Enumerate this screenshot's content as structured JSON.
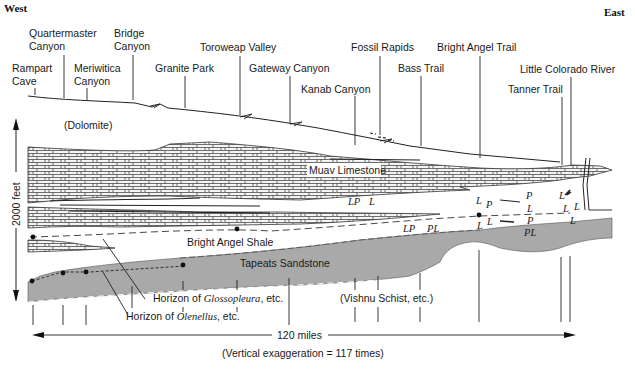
{
  "directions": {
    "west": "West",
    "east": "East"
  },
  "locations": [
    {
      "id": "rampart-cave",
      "line1": "Rampart",
      "line2": "Cave"
    },
    {
      "id": "quartermaster-canyon",
      "line1": "Quartermaster",
      "line2": "Canyon"
    },
    {
      "id": "meriwitica-canyon",
      "line1": "Meriwitica",
      "line2": "Canyon"
    },
    {
      "id": "bridge-canyon",
      "line1": "Bridge",
      "line2": "Canyon"
    },
    {
      "id": "granite-park",
      "line1": "Granite Park"
    },
    {
      "id": "toroweap-valley",
      "line1": "Toroweap Valley"
    },
    {
      "id": "gateway-canyon",
      "line1": "Gateway Canyon"
    },
    {
      "id": "kanab-canyon",
      "line1": "Kanab Canyon"
    },
    {
      "id": "fossil-rapids",
      "line1": "Fossil Rapids"
    },
    {
      "id": "bass-trail",
      "line1": "Bass Trail"
    },
    {
      "id": "bright-angel-trail",
      "line1": "Bright Angel Trail"
    },
    {
      "id": "little-colorado-river",
      "line1": "Little Colorado River"
    },
    {
      "id": "tanner-trail",
      "line1": "Tanner Trail"
    }
  ],
  "formations": {
    "dolomite": "(Dolomite)",
    "muav": "Muav Limestone",
    "shale": "Bright Angel Shale",
    "tapeats": "Tapeats Sandstone",
    "basement": "(Vishnu Schist, etc.)"
  },
  "horizons": {
    "glossopleura_prefix": "Horizon of ",
    "glossopleura_genus": "Glossopleura",
    "glossopleura_suffix": ", etc.",
    "olenellus_prefix": "Horizon of ",
    "olenellus_genus": "Olenellus",
    "olenellus_suffix": ", etc."
  },
  "fossil_markers": {
    "lp1": "LP",
    "l1": "L",
    "lp2": "LP",
    "pl1": "PL",
    "l_ba1": "L",
    "p_ba1": "P",
    "l_ba2": "L",
    "l_ba3": "L",
    "p_e1": "P",
    "l_e1": "L",
    "p_e2": "P",
    "pl_e": "PL",
    "l_t1": "L",
    "l_t2": "L",
    "l_t3": "L",
    "l_t4": "L"
  },
  "scale": {
    "vertical": "2000 feet",
    "horizontal": "120 miles",
    "exaggeration": "(Vertical exaggeration = 117 times)"
  },
  "colors": {
    "sandstone": "#a9a9a9",
    "ink": "#1a1a1a",
    "background": "#ffffff"
  }
}
